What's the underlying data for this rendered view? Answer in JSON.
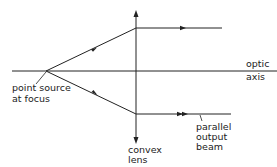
{
  "diagram": {
    "type": "ray-optics",
    "labels": {
      "optic_axis_line1": "optic",
      "optic_axis_line2": "axis",
      "point_source_line1": "point source",
      "point_source_line2": "at focus",
      "lens_line1": "convex",
      "lens_line2": "lens",
      "beam_line1": "parallel",
      "beam_line2": "output",
      "beam_line3": "beam"
    },
    "colors": {
      "line": "#222222",
      "background": "#ffffff"
    }
  }
}
